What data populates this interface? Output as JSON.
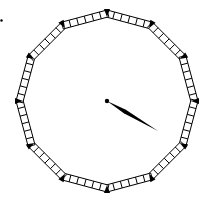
{
  "diagram": {
    "title": "Dodecagon ladder clock face",
    "canvas": {
      "width": 207,
      "height": 208,
      "background": "#ffffff"
    },
    "center": {
      "x": 107,
      "y": 101
    },
    "radius": 91,
    "sides": 12,
    "ladder": {
      "width": 7,
      "rungs_per_side": 5,
      "stroke": "#000000",
      "fill": "#ffffff"
    },
    "vertex_marker": {
      "shape": "triangle",
      "color": "#000000",
      "size": 6
    },
    "hand": {
      "label": "clock hand",
      "tip": {
        "x": 158,
        "y": 131
      },
      "base_width": 4,
      "color": "#000000",
      "pivot_radius": 2.2
    },
    "corner_dot": {
      "x": 1.5,
      "y": 20.5,
      "r": 1.2,
      "color": "#000000"
    }
  }
}
